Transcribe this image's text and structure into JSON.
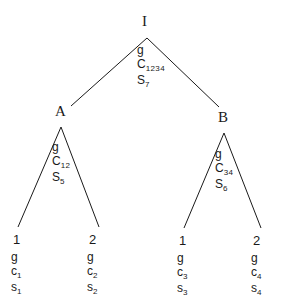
{
  "diagram": {
    "type": "tree",
    "title": "",
    "background_color": "#ffffff",
    "line_color": "#1a1a1a",
    "nodes": {
      "root": {
        "letter": "I",
        "gene_label": "g",
        "c_base": "C",
        "c_sub": "1234",
        "s_base": "S",
        "s_sub": "7"
      },
      "left": {
        "letter": "A",
        "gene_label": "g",
        "c_base": "C",
        "c_sub": "12",
        "s_base": "S",
        "s_sub": "5"
      },
      "right": {
        "letter": "B",
        "gene_label": "g",
        "c_base": "C",
        "c_sub": "34",
        "s_base": "S",
        "s_sub": "6"
      }
    },
    "leaves": [
      {
        "number": "1",
        "gene_label": "g",
        "c_base": "c",
        "c_sub": "1",
        "s_base": "s",
        "s_sub": "1"
      },
      {
        "number": "2",
        "gene_label": "g",
        "c_base": "c",
        "c_sub": "2",
        "s_base": "s",
        "s_sub": "2"
      },
      {
        "number": "1",
        "gene_label": "g",
        "c_base": "c",
        "c_sub": "3",
        "s_base": "s",
        "s_sub": "3"
      },
      {
        "number": "2",
        "gene_label": "g",
        "c_base": "c",
        "c_sub": "4",
        "s_base": "s",
        "s_sub": "4"
      }
    ]
  }
}
